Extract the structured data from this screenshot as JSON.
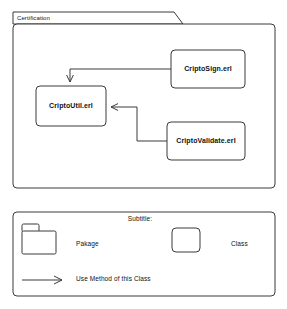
{
  "diagram": {
    "type": "uml-package-diagram",
    "package": {
      "name": "Certification",
      "classes": [
        {
          "id": "cripto_sign",
          "label": "CriptoSign.erl"
        },
        {
          "id": "cripto_util",
          "label": "CriptoUtil.erl"
        },
        {
          "id": "cripto_validate",
          "label": "CriptoValidate.erl"
        }
      ],
      "connections": [
        {
          "from": "CriptoSign.erl",
          "to": "CriptoUtil.erl",
          "kind": "use-method",
          "arrow": "open"
        },
        {
          "from": "CriptoValidate.erl",
          "to": "CriptoUtil.erl",
          "kind": "use-method",
          "arrow": "open"
        }
      ]
    },
    "legend": {
      "title": "Subtitle:",
      "items": [
        {
          "symbol": "folder-icon",
          "label": "Pakage"
        },
        {
          "symbol": "rounded-rect-icon",
          "label": "Class"
        },
        {
          "symbol": "arrow-icon",
          "label": "Use Method of this Class"
        }
      ]
    },
    "colors": {
      "stroke": "#3a3a3a",
      "text": "#111111",
      "background": "#ffffff"
    }
  }
}
